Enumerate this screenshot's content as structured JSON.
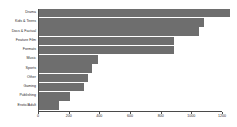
{
  "chart_data": {
    "type": "bar",
    "orientation": "horizontal",
    "title": "",
    "subtitle": "",
    "xlabel": "",
    "ylabel": "",
    "categories": [
      "Drama",
      "Kids & Teens",
      "Docs & Factual",
      "Feature Film",
      "Formats",
      "Music",
      "Sports",
      "Other",
      "Gaming",
      "Publishing",
      "Erotic/Adult"
    ],
    "values": [
      1250,
      1080,
      1050,
      890,
      890,
      390,
      355,
      325,
      300,
      210,
      135
    ],
    "xlim": [
      0,
      1200
    ],
    "xticks": [
      0,
      200,
      400,
      600,
      800,
      1000,
      1200
    ],
    "xtick_labels": [
      "0",
      "200",
      "400",
      "600",
      "800",
      "1000",
      "1200"
    ],
    "grid": false,
    "legend": null,
    "bar_color": "#6e6e6e",
    "axis_color": "#4a4a4a",
    "background": "#ffffff"
  }
}
